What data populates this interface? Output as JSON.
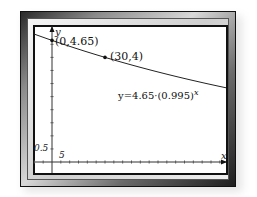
{
  "chart_data": {
    "type": "line",
    "title": "",
    "xlabel": "x",
    "ylabel": "y",
    "equation_label": "y=4.65·(0.995)",
    "equation_exponent": "x",
    "function": "y = 4.65 * 0.995^x",
    "x_tick_step": 5,
    "y_tick_step": 0.5,
    "x_tick_label": "5",
    "y_tick_label": "0.5",
    "xlim": [
      -11,
      99
    ],
    "ylim": [
      -0.5,
      5.25
    ],
    "grid": false,
    "legend": null,
    "points": [
      {
        "x": 0,
        "y": 4.65,
        "label": "(0,4.65)"
      },
      {
        "x": 30,
        "y": 4,
        "label": "(30,4)"
      }
    ],
    "series": [
      {
        "name": "y=4.65·(0.995)^x",
        "x": [
          -11,
          0,
          10,
          20,
          30,
          40,
          50,
          60,
          70,
          80,
          90,
          99
        ],
        "values": [
          4.91,
          4.65,
          4.42,
          4.21,
          4.0,
          3.8,
          3.62,
          3.44,
          3.27,
          3.11,
          2.96,
          2.83
        ]
      }
    ]
  }
}
